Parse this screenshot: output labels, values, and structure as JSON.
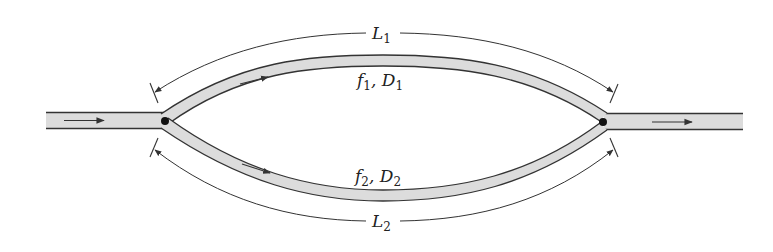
{
  "diagram": {
    "type": "parallel pipe flow",
    "colors": {
      "pipe_fill": "#dcdcdc",
      "pipe_wall": "#333333",
      "line": "#333333",
      "node": "#111111"
    },
    "labels": {
      "L1": {
        "main": "L",
        "sub": "1"
      },
      "L2": {
        "main": "L",
        "sub": "2"
      },
      "branch1": {
        "f": "f",
        "f_sub": "1",
        "sep": ", ",
        "D": "D",
        "D_sub": "1"
      },
      "branch2": {
        "f": "f",
        "f_sub": "2",
        "sep": ", ",
        "D": "D",
        "D_sub": "2"
      }
    },
    "nodes": [
      "junction-left",
      "junction-right"
    ],
    "pipes": [
      "inlet-pipe",
      "branch-1-upper",
      "branch-2-lower",
      "outlet-pipe"
    ]
  }
}
